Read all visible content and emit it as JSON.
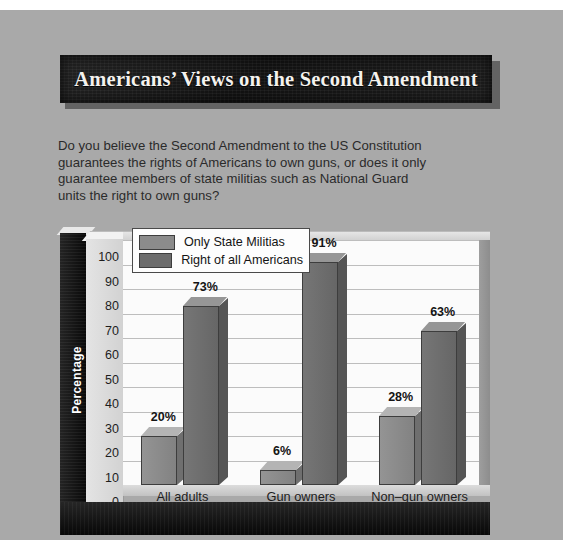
{
  "banner": {
    "title": "Americans’ Views on the Second Amendment"
  },
  "question": {
    "line1": "Do you believe the Second Amendment to the US Constitution",
    "line2": "guarantees the rights of Americans to own guns, or does it only",
    "line3": "guarantee members of state militias such as National Guard",
    "line4": "units the right to own guns?"
  },
  "legend": {
    "items": [
      {
        "label": "Only State Militias",
        "color": "#8b8b8b"
      },
      {
        "label": "Right of all Americans",
        "color": "#6c6c6c"
      }
    ]
  },
  "axis": {
    "y_title": "Percentage",
    "x_title": "View",
    "y_ticks": [
      "100",
      "90",
      "80",
      "70",
      "60",
      "50",
      "40",
      "30",
      "20",
      "10",
      "0"
    ]
  },
  "chart_data": {
    "type": "bar",
    "title": "Americans’ Views on the Second Amendment",
    "subtitle": "Do you believe the Second Amendment to the US Constitution guarantees the rights of Americans to own guns, or does it only guarantee members of state militias such as National Guard units the right to own guns?",
    "categories": [
      "All adults",
      "Gun owners",
      "Non–gun owners"
    ],
    "series": [
      {
        "name": "Only State Militias",
        "color": "#8b8b8b",
        "values": [
          20,
          6,
          28
        ],
        "labels": [
          "20%",
          "6%",
          "28%"
        ]
      },
      {
        "name": "Right of all Americans",
        "color": "#6c6c6c",
        "values": [
          73,
          91,
          63
        ],
        "labels": [
          "73%",
          "91%",
          "63%"
        ]
      }
    ],
    "xlabel": "View",
    "ylabel": "Percentage",
    "ylim": [
      0,
      100
    ],
    "ytick_step": 10,
    "grid": true,
    "legend_position": "top-left",
    "value_labels": true,
    "style_3d": true
  },
  "colors": {
    "page_background": "#a9a9a9",
    "banner_background": "#161616",
    "banner_text": "#f4f2ee",
    "frame": "#121212",
    "plot_background": "#fbfbfb",
    "gridline": "#bdbdbd"
  }
}
